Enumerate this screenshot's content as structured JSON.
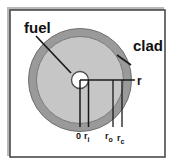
{
  "figure": {
    "type": "cross-section-diagram",
    "background_color": "#ffffff",
    "border_color": "#4a4a4a",
    "shadow_color": "#b8b8b8"
  },
  "regions": {
    "center_hole": {
      "label": "0",
      "fill": "#ffffff",
      "radius_px": 9
    },
    "fuel": {
      "label": "fuel",
      "fill": "#c6c6c6",
      "radius_px": 44
    },
    "clad": {
      "label": "clad",
      "fill": "#9a9a9a",
      "radius_px": 52
    }
  },
  "labels": {
    "fuel": "fuel",
    "clad": "clad",
    "radial_arrow": "r"
  },
  "axis_marks": [
    {
      "name": "center",
      "base": "0",
      "sub": ""
    },
    {
      "name": "inner-fuel",
      "base": "r",
      "sub": "i"
    },
    {
      "name": "outer-fuel",
      "base": "r",
      "sub": "o"
    },
    {
      "name": "outer-clad",
      "base": "r",
      "sub": "c"
    }
  ]
}
